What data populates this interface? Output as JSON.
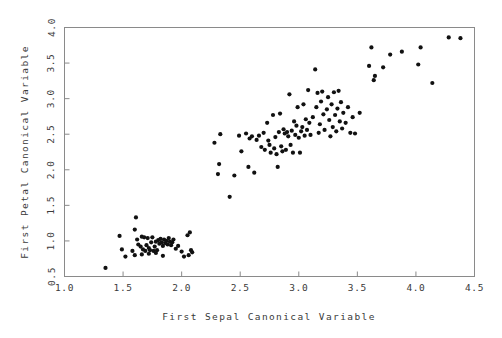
{
  "chart_data": {
    "type": "scatter",
    "title": "",
    "xlabel": "First Sepal Canonical Variable",
    "ylabel": "First Petal Canonical Variable",
    "xlim": [
      1.0,
      4.5
    ],
    "ylim": [
      0.5,
      4.0
    ],
    "xticks": [
      "1.0",
      "1.5",
      "2.0",
      "2.5",
      "3.0",
      "3.5",
      "4.0",
      "4.5"
    ],
    "yticks": [
      "0.5",
      "1.0",
      "1.5",
      "2.0",
      "2.5",
      "3.0",
      "3.5",
      "4.0"
    ],
    "xtick_values": [
      1.0,
      1.5,
      2.0,
      2.5,
      3.0,
      3.5,
      4.0,
      4.5
    ],
    "ytick_values": [
      0.5,
      1.0,
      1.5,
      2.0,
      2.5,
      3.0,
      3.5,
      4.0
    ],
    "grid": false,
    "legend": false,
    "marker": "dot",
    "marker_color": "#111111",
    "marker_size": 2.1,
    "frame_color": "#8a8a8a",
    "background": "#ffffff",
    "n_points": 150,
    "points": [
      [
        1.35,
        0.62
      ],
      [
        1.49,
        0.88
      ],
      [
        1.47,
        1.07
      ],
      [
        1.52,
        0.78
      ],
      [
        1.58,
        0.86
      ],
      [
        1.61,
        1.33
      ],
      [
        1.6,
        1.16
      ],
      [
        1.62,
        1.02
      ],
      [
        1.63,
        0.95
      ],
      [
        1.66,
        1.06
      ],
      [
        1.68,
        1.05
      ],
      [
        1.65,
        0.92
      ],
      [
        1.67,
        0.88
      ],
      [
        1.7,
        0.94
      ],
      [
        1.69,
        0.86
      ],
      [
        1.72,
        0.9
      ],
      [
        1.71,
        1.04
      ],
      [
        1.74,
        0.98
      ],
      [
        1.73,
        0.87
      ],
      [
        1.76,
        0.86
      ],
      [
        1.75,
        1.05
      ],
      [
        1.78,
        0.99
      ],
      [
        1.77,
        0.92
      ],
      [
        1.79,
        0.87
      ],
      [
        1.8,
        1.01
      ],
      [
        1.81,
        0.96
      ],
      [
        1.82,
        1.03
      ],
      [
        1.83,
        0.98
      ],
      [
        1.84,
        0.93
      ],
      [
        1.85,
        1.02
      ],
      [
        1.86,
        0.97
      ],
      [
        1.87,
        1.0
      ],
      [
        1.88,
        0.95
      ],
      [
        1.89,
        1.04
      ],
      [
        1.9,
        0.99
      ],
      [
        1.91,
        0.94
      ],
      [
        1.92,
        0.98
      ],
      [
        1.93,
        1.02
      ],
      [
        1.84,
        0.79
      ],
      [
        1.78,
        0.83
      ],
      [
        1.72,
        0.82
      ],
      [
        1.66,
        0.81
      ],
      [
        1.6,
        0.8
      ],
      [
        1.95,
        0.89
      ],
      [
        1.97,
        0.93
      ],
      [
        2.0,
        0.85
      ],
      [
        2.02,
        0.78
      ],
      [
        2.05,
        1.08
      ],
      [
        2.07,
        1.12
      ],
      [
        2.08,
        0.87
      ],
      [
        2.09,
        0.84
      ],
      [
        2.06,
        0.8
      ],
      [
        2.28,
        2.38
      ],
      [
        2.33,
        2.5
      ],
      [
        2.32,
        2.08
      ],
      [
        2.31,
        1.94
      ],
      [
        2.41,
        1.62
      ],
      [
        2.45,
        1.92
      ],
      [
        2.49,
        2.48
      ],
      [
        2.51,
        2.26
      ],
      [
        2.55,
        2.51
      ],
      [
        2.57,
        2.04
      ],
      [
        2.58,
        2.44
      ],
      [
        2.6,
        2.47
      ],
      [
        2.62,
        1.96
      ],
      [
        2.64,
        2.42
      ],
      [
        2.66,
        2.48
      ],
      [
        2.68,
        2.32
      ],
      [
        2.7,
        2.52
      ],
      [
        2.71,
        2.28
      ],
      [
        2.73,
        2.66
      ],
      [
        2.74,
        2.41
      ],
      [
        2.75,
        2.35
      ],
      [
        2.76,
        2.24
      ],
      [
        2.78,
        2.77
      ],
      [
        2.79,
        2.3
      ],
      [
        2.8,
        2.46
      ],
      [
        2.81,
        2.22
      ],
      [
        2.82,
        2.04
      ],
      [
        2.83,
        2.53
      ],
      [
        2.84,
        2.79
      ],
      [
        2.85,
        2.33
      ],
      [
        2.86,
        2.26
      ],
      [
        2.87,
        2.57
      ],
      [
        2.88,
        2.51
      ],
      [
        2.89,
        2.28
      ],
      [
        2.9,
        2.53
      ],
      [
        2.91,
        2.47
      ],
      [
        2.92,
        3.06
      ],
      [
        2.93,
        2.35
      ],
      [
        2.94,
        2.55
      ],
      [
        2.95,
        2.24
      ],
      [
        2.96,
        2.68
      ],
      [
        2.97,
        2.49
      ],
      [
        2.98,
        2.62
      ],
      [
        2.99,
        2.88
      ],
      [
        3.0,
        2.45
      ],
      [
        3.01,
        2.24
      ],
      [
        3.02,
        2.54
      ],
      [
        3.03,
        2.6
      ],
      [
        3.04,
        2.92
      ],
      [
        3.05,
        2.48
      ],
      [
        3.06,
        2.71
      ],
      [
        3.07,
        2.56
      ],
      [
        3.08,
        3.12
      ],
      [
        3.09,
        2.66
      ],
      [
        3.1,
        2.49
      ],
      [
        3.12,
        2.74
      ],
      [
        3.14,
        3.41
      ],
      [
        3.15,
        2.88
      ],
      [
        3.16,
        3.08
      ],
      [
        3.17,
        2.52
      ],
      [
        3.18,
        2.64
      ],
      [
        3.19,
        2.96
      ],
      [
        3.2,
        3.1
      ],
      [
        3.21,
        2.78
      ],
      [
        3.22,
        2.56
      ],
      [
        3.24,
        2.85
      ],
      [
        3.25,
        3.02
      ],
      [
        3.26,
        2.7
      ],
      [
        3.27,
        2.47
      ],
      [
        3.28,
        2.92
      ],
      [
        3.29,
        2.6
      ],
      [
        3.3,
        3.09
      ],
      [
        3.31,
        2.77
      ],
      [
        3.32,
        2.54
      ],
      [
        3.33,
        2.86
      ],
      [
        3.34,
        3.11
      ],
      [
        3.35,
        2.68
      ],
      [
        3.36,
        2.95
      ],
      [
        3.37,
        2.58
      ],
      [
        3.38,
        2.8
      ],
      [
        3.4,
        2.66
      ],
      [
        3.42,
        2.88
      ],
      [
        3.44,
        2.52
      ],
      [
        3.46,
        2.74
      ],
      [
        3.48,
        2.51
      ],
      [
        3.52,
        2.8
      ],
      [
        3.6,
        3.46
      ],
      [
        3.62,
        3.72
      ],
      [
        3.64,
        3.26
      ],
      [
        3.65,
        3.32
      ],
      [
        3.72,
        3.44
      ],
      [
        3.78,
        3.62
      ],
      [
        3.88,
        3.66
      ],
      [
        4.02,
        3.48
      ],
      [
        4.04,
        3.72
      ],
      [
        4.14,
        3.22
      ],
      [
        4.28,
        3.86
      ],
      [
        4.38,
        3.85
      ]
    ]
  }
}
